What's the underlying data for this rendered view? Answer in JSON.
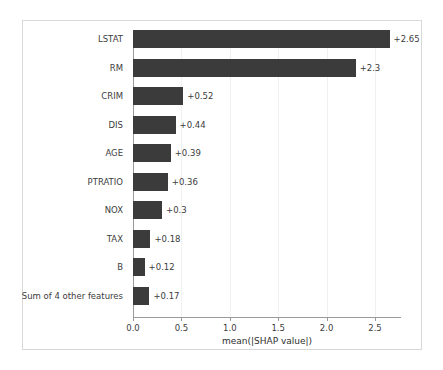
{
  "chart_data": {
    "type": "bar",
    "orientation": "horizontal",
    "title": "",
    "xlabel": "mean(|SHAP value|)",
    "ylabel": "",
    "xlim": [
      0.0,
      2.95
    ],
    "xticks": [
      "0.0",
      "0.5",
      "1.0",
      "1.5",
      "2.0",
      "2.5"
    ],
    "xtick_values": [
      0.0,
      0.5,
      1.0,
      1.5,
      2.0,
      2.5
    ],
    "grid": true,
    "legend": null,
    "bar_color": "#3b3b3b",
    "categories": [
      "LSTAT",
      "RM",
      "CRIM",
      "DIS",
      "AGE",
      "PTRATIO",
      "NOX",
      "TAX",
      "B",
      "Sum of 4 other features"
    ],
    "values": [
      2.65,
      2.3,
      0.52,
      0.44,
      0.39,
      0.36,
      0.3,
      0.18,
      0.12,
      0.17
    ],
    "value_labels": [
      "+2.65",
      "+2.3",
      "+0.52",
      "+0.44",
      "+0.39",
      "+0.36",
      "+0.3",
      "+0.18",
      "+0.12",
      "+0.17"
    ]
  }
}
